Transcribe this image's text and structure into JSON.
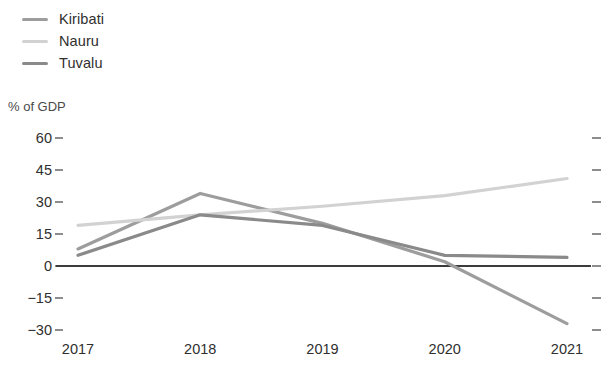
{
  "chart_data": {
    "type": "line",
    "title": "",
    "subtitle": "",
    "xlabel": "",
    "ylabel": "% of GDP",
    "categories": [
      "2017",
      "2018",
      "2019",
      "2020",
      "2021"
    ],
    "x": [
      2017,
      2018,
      2019,
      2020,
      2021
    ],
    "series": [
      {
        "name": "Kiribati",
        "color": "#9d9d9d",
        "values": [
          8,
          34,
          20,
          2,
          -27
        ]
      },
      {
        "name": "Nauru",
        "color": "#d2d2d2",
        "values": [
          19,
          24,
          28,
          33,
          41
        ]
      },
      {
        "name": "Tuvalu",
        "color": "#8a8a8a",
        "values": [
          5,
          24,
          19,
          5,
          4
        ]
      }
    ],
    "ylim": [
      -30,
      60
    ],
    "yticks": [
      60,
      45,
      30,
      15,
      0,
      -15,
      -30
    ],
    "ytick_labels": [
      "60",
      "45",
      "30",
      "15",
      "0",
      "−15",
      "−30"
    ],
    "grid": false,
    "zero_line": true,
    "legend_position": "top-left",
    "legend_entries": [
      "Kiribati",
      "Nauru",
      "Tuvalu"
    ]
  },
  "legend": {
    "items": [
      {
        "label": "Kiribati"
      },
      {
        "label": "Nauru"
      },
      {
        "label": "Tuvalu"
      }
    ]
  },
  "axes": {
    "y_unit_label": "% of GDP",
    "y_labels": [
      "60",
      "45",
      "30",
      "15",
      "0",
      "−15",
      "−30"
    ],
    "x_labels": [
      "2017",
      "2018",
      "2019",
      "2020",
      "2021"
    ]
  },
  "colors": {
    "kiribati": "#9d9d9d",
    "nauru": "#d2d2d2",
    "tuvalu": "#8a8a8a",
    "axis": "#8d8d8d",
    "zero_line": "#3b3b3b",
    "text": "#2f2f2f"
  }
}
